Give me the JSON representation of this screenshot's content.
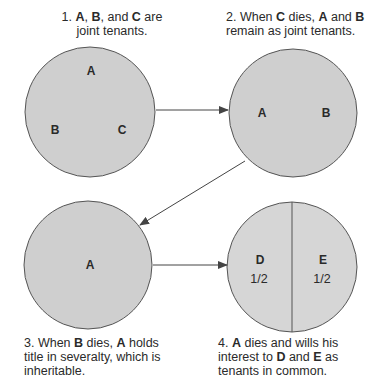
{
  "steps": [
    {
      "number": "1.",
      "caption_parts": [
        {
          "text": "A",
          "bold": true
        },
        {
          "text": ", ",
          "bold": false
        },
        {
          "text": "B",
          "bold": true
        },
        {
          "text": ", and ",
          "bold": false
        },
        {
          "text": "C",
          "bold": true
        },
        {
          "text": " are joint tenants.",
          "bold": false
        }
      ],
      "labels": [
        "A",
        "B",
        "C"
      ]
    },
    {
      "number": "2.",
      "caption_parts": [
        {
          "text": "When ",
          "bold": false
        },
        {
          "text": "C",
          "bold": true
        },
        {
          "text": " dies, ",
          "bold": false
        },
        {
          "text": "A",
          "bold": true
        },
        {
          "text": " and ",
          "bold": false
        },
        {
          "text": "B",
          "bold": true
        },
        {
          "text": " remain as joint tenants.",
          "bold": false
        }
      ],
      "labels": [
        "A",
        "B"
      ]
    },
    {
      "number": "3.",
      "caption_parts": [
        {
          "text": "When ",
          "bold": false
        },
        {
          "text": "B",
          "bold": true
        },
        {
          "text": " dies, ",
          "bold": false
        },
        {
          "text": "A",
          "bold": true
        },
        {
          "text": " holds title in severalty, which is inheritable.",
          "bold": false
        }
      ],
      "labels": [
        "A"
      ]
    },
    {
      "number": "4.",
      "caption_parts": [
        {
          "text": "A",
          "bold": true
        },
        {
          "text": " dies and wills his interest to ",
          "bold": false
        },
        {
          "text": "D",
          "bold": true
        },
        {
          "text": " and ",
          "bold": false
        },
        {
          "text": "E",
          "bold": true
        },
        {
          "text": " as tenants in common.",
          "bold": false
        }
      ],
      "labels": [
        "D",
        "E"
      ],
      "shares": [
        "1/2",
        "1/2"
      ]
    }
  ],
  "colors": {
    "circle_fill": "#cfcfcf",
    "circle_fill_split": "#d6d6d6",
    "stroke": "#555555",
    "arrow": "#444444"
  }
}
